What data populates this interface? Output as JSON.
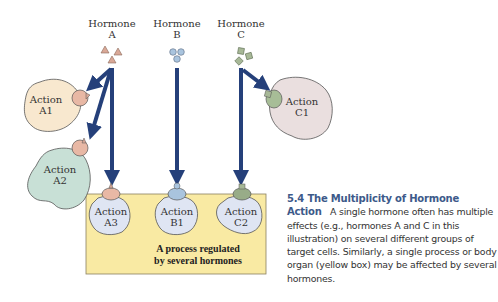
{
  "hormones": [
    {
      "name": "Hormone",
      "id": "A",
      "shape": "triangle",
      "color": "#d9a897"
    },
    {
      "name": "Hormone",
      "id": "B",
      "shape": "circle",
      "color": "#a9c4de"
    },
    {
      "name": "Hormone",
      "id": "C",
      "shape": "square",
      "color": "#a7b897"
    }
  ],
  "actions": {
    "a1": {
      "line1": "Action",
      "line2": "A1",
      "color": "#f8e8cf"
    },
    "a2": {
      "line1": "Action",
      "line2": "A2",
      "color": "#c8e0d6"
    },
    "a3": {
      "line1": "Action",
      "line2": "A3",
      "color": "#dfe5f3"
    },
    "b1": {
      "line1": "Action",
      "line2": "B1",
      "color": "#dfe5f3"
    },
    "c1": {
      "line1": "Action",
      "line2": "C1",
      "color": "#eadfdf"
    },
    "c2": {
      "line1": "Action",
      "line2": "C2",
      "color": "#dfe5f3"
    }
  },
  "yellow_box": {
    "line1": "A process regulated",
    "line2": "by several hormones",
    "color": "#f9eaa3"
  },
  "arrow_color": "#25407a",
  "caption": {
    "heading": "5.4  The Multiplicity of Hormone Action",
    "body": "A single hormone often has multiple effects (e.g., hormones A and C in this illustration) on several different groups of target cells. Similarly, a single process or body organ (yellow box) may be affected by several hormones."
  }
}
